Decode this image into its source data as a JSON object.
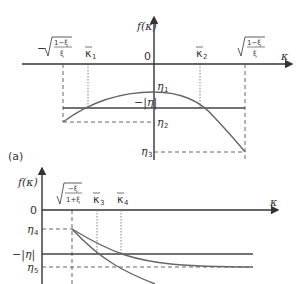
{
  "figure": {
    "panel_label": "(a)",
    "top_panel": {
      "y_axis_label": "f(κ)",
      "x_axis_label": "κ",
      "origin_label": "0",
      "x_ticks": {
        "left_bound_sign": "−",
        "left_bound_num": "1−ξ",
        "left_bound_den": "ξ",
        "kappa1": "κ",
        "kappa1_sub": "1",
        "kappa2": "κ",
        "kappa2_sub": "2",
        "right_bound_num": "1−ξ",
        "right_bound_den": "ξ"
      },
      "y_levels": {
        "eta1": "η",
        "eta1_sub": "1",
        "neg_abs_eta": "−|η|",
        "eta2": "η",
        "eta2_sub": "2",
        "eta3": "η",
        "eta3_sub": "3"
      }
    },
    "bottom_panel": {
      "y_axis_label": "f(κ)",
      "x_axis_label": "κ",
      "origin_label": "0",
      "x_ticks": {
        "bound_num": "−ξ",
        "bound_den": "1+ξ",
        "kappa3": "κ",
        "kappa3_sub": "3",
        "kappa4": "κ",
        "kappa4_sub": "4"
      },
      "y_levels": {
        "eta4": "η",
        "eta4_sub": "4",
        "neg_abs_eta": "−|η|",
        "eta5": "η",
        "eta5_sub": "5"
      }
    }
  }
}
